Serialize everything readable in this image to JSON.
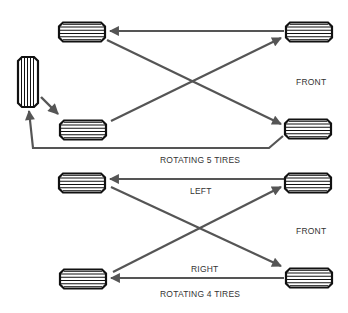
{
  "diagram": {
    "type": "tire-rotation",
    "colors": {
      "arrow": "#555555",
      "tire_outline": "#111111",
      "tire_fill": "#ffffff",
      "text": "#333333"
    },
    "section_5": {
      "title": "ROTATING 5 TIRES",
      "front_label": "FRONT",
      "tires": [
        {
          "id": "left-rear",
          "orientation": "horizontal"
        },
        {
          "id": "right-rear",
          "orientation": "horizontal"
        },
        {
          "id": "left-front",
          "orientation": "horizontal"
        },
        {
          "id": "right-front",
          "orientation": "horizontal"
        },
        {
          "id": "spare",
          "orientation": "vertical"
        }
      ],
      "moves": [
        {
          "from": "right-front(top)",
          "to": "left-top"
        },
        {
          "from": "left-bottom",
          "to": "right-top"
        },
        {
          "from": "left-top",
          "to": "right-bottom"
        },
        {
          "from": "spare",
          "to": "left-bottom"
        },
        {
          "from": "right-bottom",
          "to": "spare"
        }
      ]
    },
    "section_4": {
      "title": "ROTATING 4 TIRES",
      "front_label": "FRONT",
      "left_label": "LEFT",
      "right_label": "RIGHT",
      "tires": [
        {
          "id": "left-top",
          "orientation": "horizontal"
        },
        {
          "id": "right-top",
          "orientation": "horizontal"
        },
        {
          "id": "left-bottom",
          "orientation": "horizontal"
        },
        {
          "id": "right-bottom",
          "orientation": "horizontal"
        }
      ],
      "moves": [
        {
          "from": "right-top",
          "to": "left-top"
        },
        {
          "from": "left-bottom",
          "to": "right-top"
        },
        {
          "from": "left-top",
          "to": "right-bottom"
        },
        {
          "from": "right-bottom",
          "to": "left-bottom"
        }
      ]
    }
  }
}
